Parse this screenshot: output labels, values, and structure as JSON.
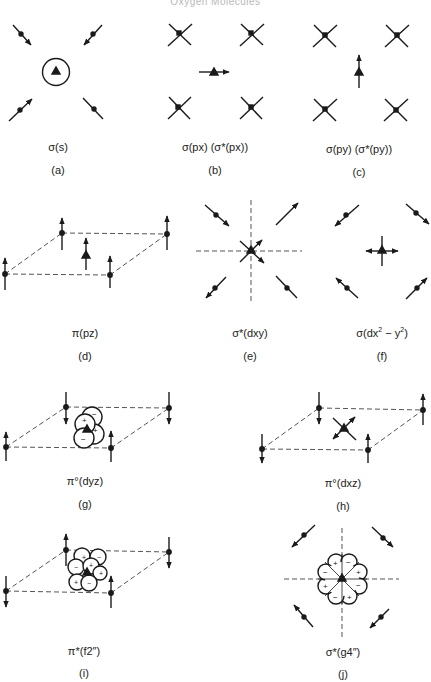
{
  "header": {
    "text": "Oxygen Molecules"
  },
  "panels": [
    {
      "id": "a",
      "orbital": "σ(s)",
      "tag": "(a)"
    },
    {
      "id": "b",
      "orbital": "σ(px) (σ*(px))",
      "tag": "(b)"
    },
    {
      "id": "c",
      "orbital": "σ(py) (σ*(py))",
      "tag": "(c)"
    },
    {
      "id": "d",
      "orbital": "π(pz)",
      "tag": "(d)"
    },
    {
      "id": "e",
      "orbital": "σ*(dxy)",
      "tag": "(e)"
    },
    {
      "id": "f",
      "orbital_pre": "σ(dx",
      "sup1": "2",
      "orbital_mid": " − y",
      "sup2": "2",
      "orbital_post": ")",
      "tag": "(f)"
    },
    {
      "id": "g",
      "orbital": "π°(dyz)",
      "tag": "(g)"
    },
    {
      "id": "h",
      "orbital": "π°(dxz)",
      "tag": "(h)"
    },
    {
      "id": "i",
      "orbital": "π*(f2″)",
      "tag": "(i)"
    },
    {
      "id": "j",
      "orbital": "σ*(g4″)",
      "tag": "(j)"
    }
  ],
  "lobe_signs": {
    "g": [
      "+",
      "−",
      "−",
      "+"
    ],
    "i": [
      "+",
      "−",
      "+",
      "−",
      "+",
      "−",
      "+"
    ],
    "j": [
      "+",
      "−",
      "+",
      "−",
      "+",
      "−",
      "+",
      "−"
    ]
  },
  "colors": {
    "ink": "#1a1a1a",
    "dash": "#555555",
    "header": "#b8b8b8"
  }
}
